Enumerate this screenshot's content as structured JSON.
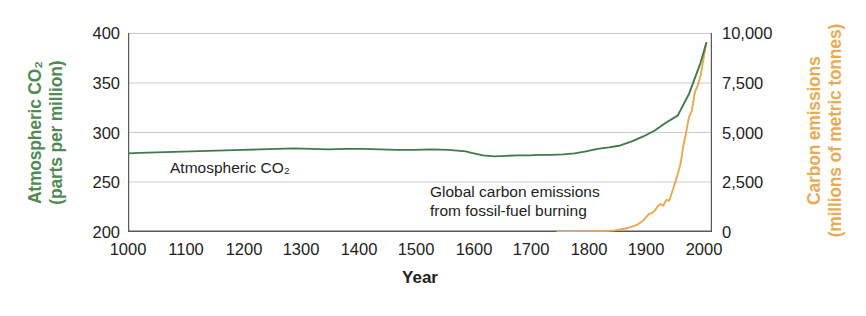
{
  "chart_data": {
    "type": "line",
    "title": "",
    "xlabel": "Year",
    "xlim": [
      1000,
      2020
    ],
    "xticks": [
      1000,
      1100,
      1200,
      1300,
      1400,
      1500,
      1600,
      1700,
      1800,
      1900,
      2000
    ],
    "xticklabels": [
      "1000",
      "1100",
      "1200",
      "1300",
      "1400",
      "1500",
      "1600",
      "1700",
      "1800",
      "1900",
      "2000"
    ],
    "grid": true,
    "grid_axis": "y",
    "legend": "inline annotations",
    "axes": [
      {
        "id": "left",
        "label_line1": "Atmospheric CO₂",
        "label_line2": "(parts per million)",
        "color": "#4f8a52",
        "ylim": [
          200,
          400
        ],
        "yticks": [
          200,
          250,
          300,
          350,
          400
        ],
        "yticklabels": [
          "200",
          "250",
          "300",
          "350",
          "400"
        ]
      },
      {
        "id": "right",
        "label_line1": "Carbon emissions",
        "label_line2": "(millions of metric tonnes)",
        "color": "#e8ab54",
        "ylim": [
          0,
          10000
        ],
        "yticks": [
          0,
          2500,
          5000,
          7500,
          10000
        ],
        "yticklabels": [
          "0",
          "2,500",
          "5,000",
          "7,500",
          "10,000"
        ]
      }
    ],
    "series": [
      {
        "name": "Atmospheric CO2",
        "annotation": "Atmospheric CO₂",
        "axis": "left",
        "color": "#3f7a4a",
        "unit": "parts per million",
        "x": [
          1000,
          1020,
          1050,
          1080,
          1110,
          1140,
          1170,
          1200,
          1230,
          1260,
          1290,
          1320,
          1350,
          1380,
          1410,
          1440,
          1470,
          1500,
          1530,
          1560,
          1590,
          1600,
          1620,
          1640,
          1660,
          1680,
          1700,
          1720,
          1740,
          1760,
          1780,
          1800,
          1820,
          1840,
          1860,
          1880,
          1900,
          1920,
          1940,
          1960,
          1980,
          2000,
          2010
        ],
        "y": [
          279,
          279.5,
          280,
          280.5,
          281,
          281.5,
          282,
          282.5,
          283,
          283.5,
          284,
          283.5,
          283,
          283.5,
          283.5,
          283,
          282.5,
          282.5,
          283,
          282.5,
          281,
          279.5,
          277,
          276,
          276.5,
          277,
          277,
          277.5,
          277.5,
          278,
          279,
          281,
          283.5,
          285,
          287,
          291,
          296,
          302,
          310,
          317,
          339,
          370,
          390
        ]
      },
      {
        "name": "Global carbon emissions from fossil-fuel burning",
        "annotation_line1": "Global carbon emissions",
        "annotation_line2": "from fossil-fuel burning",
        "axis": "right",
        "color": "#e8a94f",
        "unit": "millions of metric tonnes",
        "x": [
          1750,
          1770,
          1790,
          1800,
          1810,
          1820,
          1830,
          1840,
          1850,
          1860,
          1870,
          1880,
          1890,
          1900,
          1910,
          1915,
          1920,
          1925,
          1930,
          1935,
          1940,
          1945,
          1950,
          1955,
          1960,
          1965,
          1970,
          1975,
          1980,
          1985,
          1990,
          1995,
          2000,
          2005,
          2010
        ],
        "y": [
          10,
          15,
          25,
          35,
          50,
          70,
          100,
          140,
          200,
          300,
          450,
          650,
          900,
          1400,
          2200,
          2300,
          2600,
          3100,
          3400,
          3200,
          3900,
          3800,
          4800,
          5900,
          7000,
          8300,
          10500,
          12200,
          14000,
          14800,
          17000,
          17800,
          19000,
          21000,
          23000
        ],
        "y_note": "Values plotted against right axis scaled 0-10,000 with the curve reaching about 9,500 at 2010"
      }
    ],
    "annotations": [
      {
        "text": "Atmospheric CO₂",
        "x_year": 1180,
        "y_value": 262
      },
      {
        "text": "Global carbon emissions",
        "x_year": 1640,
        "y_value": 238
      },
      {
        "text": "from fossil-fuel burning",
        "x_year": 1640,
        "y_value": 227
      }
    ]
  },
  "axis_titles": {
    "left_line1": "Atmospheric CO₂",
    "left_line2": "(parts per million)",
    "right_line1": "Carbon emissions",
    "right_line2": "(millions of metric tonnes)",
    "x": "Year"
  },
  "colors": {
    "co2_line": "#3f7a4a",
    "emissions_line": "#e8a94f",
    "co2_label": "#4f8a52",
    "emissions_label": "#e8ab54",
    "axis": "#58595b",
    "grid": "#c9ccce",
    "text": "#231f20",
    "background": "#fefefe"
  }
}
